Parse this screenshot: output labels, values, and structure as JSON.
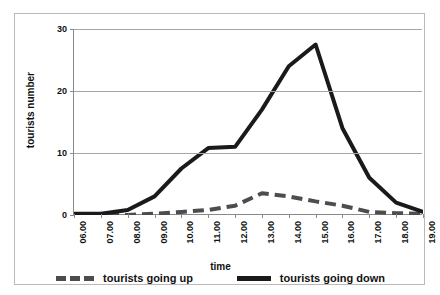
{
  "chart_data": {
    "type": "line",
    "title": "",
    "xlabel": "time",
    "ylabel": "tourists number",
    "ylim": [
      0,
      30
    ],
    "yticks": [
      0,
      10,
      20,
      30
    ],
    "grid": true,
    "legend_position": "bottom",
    "categories": [
      "06.00",
      "07.00",
      "08.00",
      "09.00",
      "10.00",
      "11.00",
      "12.00",
      "13.00",
      "14.00",
      "15.00",
      "16.00",
      "17.00",
      "18.00",
      "19.00"
    ],
    "series": [
      {
        "name": "tourists going up",
        "style": "dashed",
        "color": "#4d4d4d",
        "values": [
          0,
          0,
          0,
          0.2,
          0.5,
          0.8,
          1.5,
          3.5,
          3,
          2.2,
          1.5,
          0.5,
          0.3,
          0.2
        ]
      },
      {
        "name": "tourists going down",
        "style": "solid",
        "color": "#1a1a1a",
        "values": [
          0.2,
          0.2,
          0.8,
          3,
          7.5,
          10.8,
          11,
          17,
          24,
          27.5,
          14,
          6,
          2,
          0.5
        ]
      }
    ]
  },
  "axes": {
    "y_title": "tourists number",
    "x_title": "time",
    "y_tick_labels": [
      "0",
      "10",
      "20",
      "30"
    ],
    "x_tick_labels": [
      "06.00",
      "07.00",
      "08.00",
      "09.00",
      "10.00",
      "11.00",
      "12.00",
      "13.00",
      "14.00",
      "15.00",
      "16.00",
      "17.00",
      "18.00",
      "19.00"
    ]
  },
  "legend": {
    "items": [
      {
        "label": "tourists going up",
        "style": "dashed"
      },
      {
        "label": "tourists going down",
        "style": "solid"
      }
    ]
  },
  "colors": {
    "grid": "#a6a6a6",
    "axis": "#8a8a8a",
    "frame": "#b9b9b9",
    "series_up": "#4d4d4d",
    "series_down": "#1a1a1a",
    "background": "#ffffff"
  }
}
